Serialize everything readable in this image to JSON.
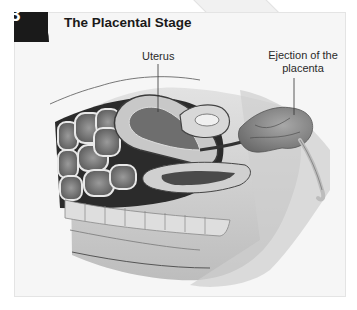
{
  "figure": {
    "step_number": "3",
    "title": "The Placental Stage",
    "labels": {
      "uterus": "Uterus",
      "ejection_line1": "Ejection of the",
      "ejection_line2": "placenta"
    }
  },
  "colors": {
    "panel_bg": "#f6f6f6",
    "badge_bg": "#1a1a1a",
    "badge_text": "#ffffff",
    "tissue_dark": "#2b2b2b",
    "tissue_mid": "#8a8a8a",
    "tissue_light": "#d9d9d9"
  }
}
